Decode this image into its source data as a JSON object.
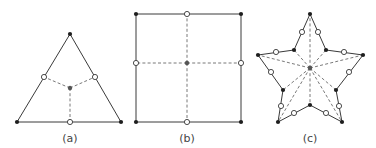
{
  "figure": {
    "panels": [
      {
        "id": "a",
        "label": "(a)",
        "shape": "triangle",
        "vertices": [
          [
            70,
            34
          ],
          [
            121,
            122
          ],
          [
            17,
            122
          ]
        ],
        "edge_midpoints": [
          [
            95,
            77
          ],
          [
            70,
            122
          ],
          [
            44,
            77
          ]
        ],
        "center": [
          70,
          88
        ]
      },
      {
        "id": "b",
        "label": "(b)",
        "shape": "square",
        "vertices": [
          [
            136,
            14
          ],
          [
            241,
            14
          ],
          [
            241,
            122
          ],
          [
            136,
            122
          ]
        ],
        "edge_midpoints": [
          [
            187,
            14
          ],
          [
            241,
            63
          ],
          [
            187,
            122
          ],
          [
            136,
            63
          ]
        ],
        "center": [
          187,
          63
        ]
      },
      {
        "id": "c",
        "label": "(c)",
        "shape": "star",
        "vertices": [
          [
            310,
            14
          ],
          [
            326,
            50
          ],
          [
            363,
            55
          ],
          [
            336,
            90
          ],
          [
            342,
            122
          ],
          [
            310,
            105
          ],
          [
            278,
            122
          ],
          [
            283,
            90
          ],
          [
            258,
            55
          ],
          [
            294,
            50
          ]
        ],
        "edge_midpoints": [
          [
            318,
            32
          ],
          [
            344,
            52
          ],
          [
            349,
            72
          ],
          [
            339,
            106
          ],
          [
            326,
            113
          ],
          [
            294,
            113
          ],
          [
            281,
            106
          ],
          [
            271,
            72
          ],
          [
            276,
            52
          ],
          [
            302,
            32
          ]
        ],
        "center": [
          310,
          68
        ]
      }
    ],
    "legend": {
      "filled_node": "vertex node",
      "open_node": "edge midpoint node",
      "dashed_line": "connection to centroid"
    }
  }
}
